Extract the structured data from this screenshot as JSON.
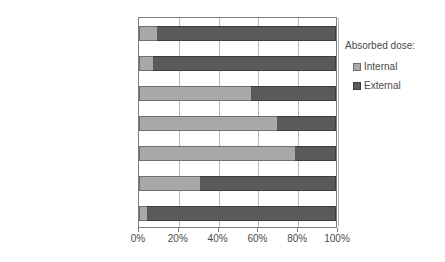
{
  "chart_data": {
    "type": "bar",
    "orientation": "horizontal",
    "stacked": true,
    "normalized": "100%",
    "title": "",
    "subtitle": "",
    "xlabel": "",
    "ylabel": "",
    "xlim": [
      0,
      100
    ],
    "xticks": [
      0,
      20,
      40,
      60,
      80,
      100
    ],
    "xtick_labels": [
      "0%",
      "20%",
      "40%",
      "60%",
      "80%",
      "100%"
    ],
    "grid": true,
    "grid_axis": "x",
    "legend_title": "Absorbed dose:",
    "legend_position": "right",
    "categories": [
      "Pripyat River",
      "Uzh River",
      "Cooling pond",
      "Yanovsky Backwater",
      "Azbuchin Lake",
      "Dalekoye-1 Lake",
      "Glubokoye Lake"
    ],
    "series": [
      {
        "name": "Internal",
        "color": "#a8a8a8",
        "values": [
          9,
          7,
          57,
          70,
          79,
          31,
          4
        ]
      },
      {
        "name": "External",
        "color": "#5a5a5a",
        "values": [
          91,
          93,
          43,
          30,
          21,
          69,
          96
        ]
      }
    ]
  },
  "legend": {
    "title": "Absorbed dose:",
    "entries": [
      {
        "label": "Internal",
        "swatch": "internal"
      },
      {
        "label": "External",
        "swatch": "external"
      }
    ]
  }
}
